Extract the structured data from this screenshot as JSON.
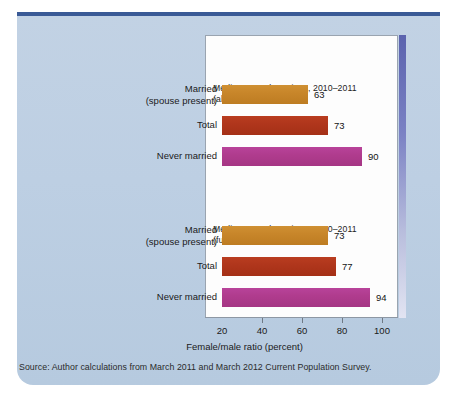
{
  "figure": {
    "axis_title": "Female/male ratio (percent)",
    "source_note": "Source: Author calculations from March 2011 and March 2012 Current Population Survey."
  },
  "colors": {
    "panel_background": "#bdcfe3",
    "plot_background": "#fdfdfd",
    "top_rule": "#3a5a96",
    "accent_bar": "#5b63ae",
    "bar_orange": "#c8862a",
    "bar_red": "#b0361c",
    "bar_magenta": "#b03c8e"
  },
  "chart_data": {
    "type": "bar",
    "orientation": "horizontal",
    "title": "",
    "xlabel": "Female/male ratio (percent)",
    "ylabel": "",
    "xlim": [
      20,
      108
    ],
    "xticks": [
      20,
      40,
      60,
      80,
      100
    ],
    "xtick_labels": [
      "20",
      "40",
      "60",
      "80",
      "100"
    ],
    "grid": false,
    "legend": false,
    "groups": [
      {
        "title": "Median annual earnings, 2010–2011\n(all workers)",
        "title_line1": "Median annual earnings, 2010–2011",
        "title_line2": "(all workers)",
        "categories": [
          "Married\n(spouse present)",
          "Total",
          "Never married"
        ],
        "category_labels": [
          {
            "line1": "Married",
            "line2": "(spouse present)"
          },
          {
            "line1": "Total",
            "line2": ""
          },
          {
            "line1": "Never married",
            "line2": ""
          }
        ],
        "values": [
          63,
          73,
          90
        ],
        "value_labels": [
          "63",
          "73",
          "90"
        ],
        "bar_colors": [
          "#c8862a",
          "#b0361c",
          "#b03c8e"
        ]
      },
      {
        "title": "Median annual earnings, 2010–2011\n(full-time, full-year workers)",
        "title_line1": "Median annual earnings, 2010–2011",
        "title_line2": "(full-time, full-year workers)",
        "categories": [
          "Married\n(spouse present)",
          "Total",
          "Never married"
        ],
        "category_labels": [
          {
            "line1": "Married",
            "line2": "(spouse present)"
          },
          {
            "line1": "Total",
            "line2": ""
          },
          {
            "line1": "Never married",
            "line2": ""
          }
        ],
        "values": [
          73,
          77,
          94
        ],
        "value_labels": [
          "73",
          "77",
          "94"
        ],
        "bar_colors": [
          "#c8862a",
          "#b0361c",
          "#b03c8e"
        ]
      }
    ]
  }
}
